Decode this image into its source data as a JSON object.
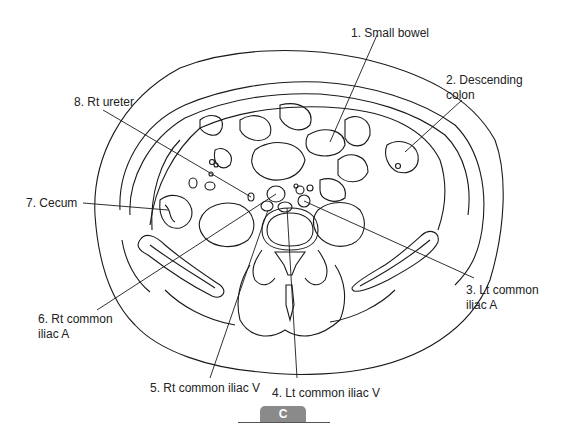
{
  "figure": {
    "panel_label": "C",
    "stroke_color": "#1a1a1a",
    "badge_color": "#8a8a8a"
  },
  "labels": [
    {
      "id": 1,
      "text": "1. Small bowel"
    },
    {
      "id": 2,
      "text": "2. Descending",
      "text2": "colon"
    },
    {
      "id": 3,
      "text": "3. Lt common",
      "text2": "iliac A"
    },
    {
      "id": 4,
      "text": "4. Lt common iliac V"
    },
    {
      "id": 5,
      "text": "5. Rt common iliac V"
    },
    {
      "id": 6,
      "text": "6. Rt common",
      "text2": "iliac A"
    },
    {
      "id": 7,
      "text": "7. Cecum"
    },
    {
      "id": 8,
      "text": "8. Rt ureter"
    }
  ]
}
